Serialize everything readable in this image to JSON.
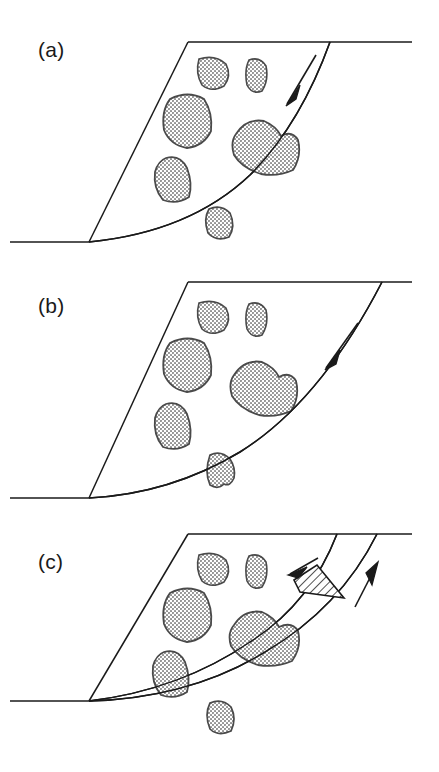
{
  "figure": {
    "type": "structural-geology-diagram",
    "width": 439,
    "height": 772,
    "background_color": "#ffffff",
    "line_color": "#1a1a1a",
    "clast_fill_color": "#cccccc",
    "clast_outline_color": "#333333",
    "hatch_color": "#1a1a1a"
  },
  "panels": [
    {
      "id": "a",
      "label": "(a)",
      "stage_description": "Single planar fault cuts through block; large central clast bisected, not yet offset",
      "ground_line": {
        "y": 242,
        "x_start": 10,
        "x_end": 89
      },
      "top_surface": {
        "y": 42,
        "x_start": 188,
        "x_end": 412
      },
      "hinge_point": {
        "x": 89,
        "y": 242
      },
      "left_edge": {
        "from": [
          89,
          242
        ],
        "to": [
          188,
          42
        ]
      },
      "fault_top_intersection": {
        "x": 330,
        "y": 42
      },
      "curved_fault": {
        "path": "M89,242 Q190,232 250,175 Q300,125 330,42",
        "kind": "listric-detachment"
      },
      "shear_arrows": [
        {
          "name": "half-arrow-down-left",
          "direction": "down-left",
          "tail": [
            313,
            59
          ],
          "head": [
            288,
            101
          ],
          "sense": "normal"
        }
      ],
      "clasts": [
        {
          "name": "clast-small-upper-left",
          "cx": 213,
          "cy": 72,
          "rx": 16,
          "ry": 17
        },
        {
          "name": "clast-small-upper-right",
          "cx": 256,
          "cy": 76,
          "rx": 11,
          "ry": 17
        },
        {
          "name": "clast-large-left",
          "cx": 188,
          "cy": 120,
          "rx": 24,
          "ry": 27
        },
        {
          "name": "clast-medium-lower-left",
          "cx": 172,
          "cy": 180,
          "rx": 20,
          "ry": 23
        },
        {
          "name": "clast-large-center",
          "cx": 264,
          "cy": 148,
          "rx": 35,
          "ry": 27
        },
        {
          "name": "clast-small-bottom",
          "cx": 219,
          "cy": 224,
          "rx": 17,
          "ry": 17
        }
      ],
      "cut_clast": "clast-large-center"
    },
    {
      "id": "b",
      "label": "(b)",
      "stage_description": "Fault has flattened and stepped; central clast now rides above the fault, small clast dragged below",
      "ground_line": {
        "y": 242,
        "x_start": 10,
        "x_end": 89
      },
      "top_surface": {
        "y": 26,
        "x_start": 188,
        "x_end": 412
      },
      "hinge_point": {
        "x": 89,
        "y": 242
      },
      "left_edge": {
        "from": [
          89,
          242
        ],
        "to": [
          188,
          26
        ]
      },
      "fault_top_intersection": {
        "x": 382,
        "y": 26
      },
      "curved_fault": {
        "path": "M89,242 Q170,238 240,196 Q320,146 382,26",
        "kind": "listric-detachment"
      },
      "shear_arrows": [
        {
          "name": "half-arrow-down-left",
          "direction": "down-left",
          "tail": [
            355,
            72
          ],
          "head": [
            327,
            108
          ],
          "sense": "normal"
        }
      ],
      "clasts": [
        {
          "name": "clast-small-upper-left",
          "cx": 213,
          "cy": 60,
          "rx": 16,
          "ry": 17
        },
        {
          "name": "clast-small-upper-right",
          "cx": 256,
          "cy": 64,
          "rx": 11,
          "ry": 18
        },
        {
          "name": "clast-large-left",
          "cx": 188,
          "cy": 108,
          "rx": 24,
          "ry": 27
        },
        {
          "name": "clast-medium-lower-left",
          "cx": 172,
          "cy": 170,
          "rx": 20,
          "ry": 24
        },
        {
          "name": "clast-large-center",
          "cx": 262,
          "cy": 133,
          "rx": 34,
          "ry": 27
        },
        {
          "name": "clast-small-bottom",
          "cx": 220,
          "cy": 215,
          "rx": 17,
          "ry": 18
        }
      ],
      "displaced_clast": "clast-large-center"
    },
    {
      "id": "c",
      "label": "(c)",
      "stage_description": "Second fault strand nucleates; hatched wedge isolated between conjugate strands with opposing shear senses",
      "ground_line": {
        "y": 189,
        "x_start": 10,
        "x_end": 89
      },
      "top_surface": {
        "y": 22,
        "x_start": 188,
        "x_end": 412
      },
      "hinge_point": {
        "x": 89,
        "y": 189
      },
      "left_edge": {
        "from": [
          89,
          189
        ],
        "to": [
          188,
          22
        ]
      },
      "fault_strands": [
        {
          "name": "inner-fault",
          "path": "M89,189 Q180,178 250,130 Q310,92 337,22",
          "top_intersection": {
            "x": 337,
            "y": 22
          }
        },
        {
          "name": "outer-fault",
          "path": "M89,189 Q190,186 265,140 Q340,96 377,22",
          "top_intersection": {
            "x": 377,
            "y": 22
          }
        }
      ],
      "wedge": {
        "name": "hatched-wedge",
        "points": "294,68 317,53 344,86 300,80",
        "fill_pattern": "diagonal-hatch",
        "hatch_angle_deg": 45
      },
      "shear_arrows": [
        {
          "name": "half-arrow-down-left",
          "direction": "down-left",
          "tail": [
            313,
            50
          ],
          "head": [
            289,
            64
          ],
          "sense": "normal"
        },
        {
          "name": "half-arrow-up-right",
          "direction": "up-right",
          "tail": [
            357,
            92
          ],
          "head": [
            375,
            56
          ],
          "sense": "reverse"
        }
      ],
      "clasts": [
        {
          "name": "clast-small-upper-left",
          "cx": 213,
          "cy": 56,
          "rx": 16,
          "ry": 17
        },
        {
          "name": "clast-small-upper-right",
          "cx": 256,
          "cy": 60,
          "rx": 11,
          "ry": 18
        },
        {
          "name": "clast-large-left",
          "cx": 188,
          "cy": 102,
          "rx": 24,
          "ry": 27
        },
        {
          "name": "clast-medium-lower-left",
          "cx": 170,
          "cy": 162,
          "rx": 20,
          "ry": 24
        },
        {
          "name": "clast-large-center",
          "cx": 262,
          "cy": 127,
          "rx": 35,
          "ry": 27
        },
        {
          "name": "clast-small-bottom",
          "cx": 220,
          "cy": 207,
          "rx": 17,
          "ry": 18
        }
      ]
    }
  ]
}
